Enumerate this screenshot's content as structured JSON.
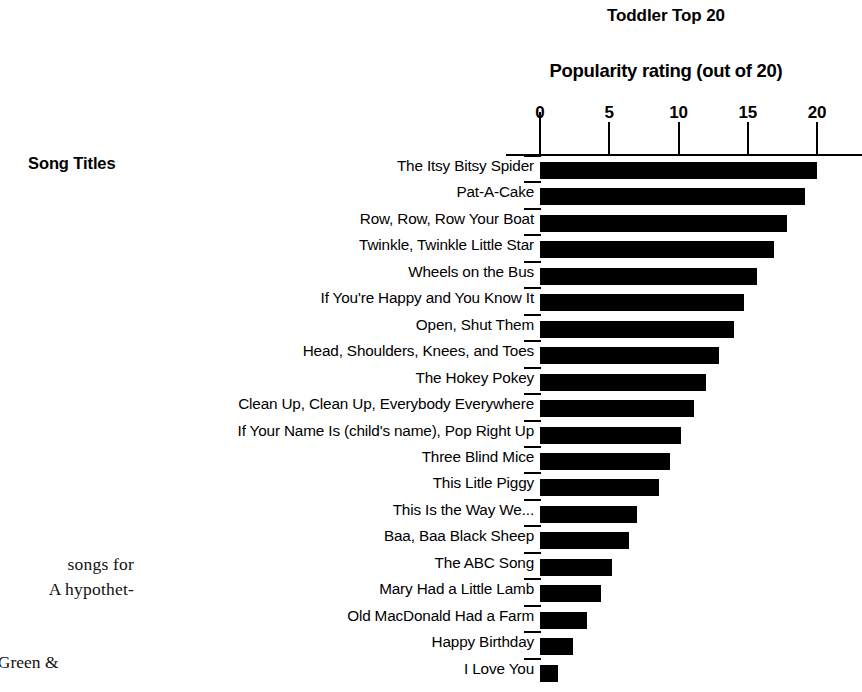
{
  "page_text": {
    "paragraph_lines": [
      "songs  for",
      "A hypothet-"
    ],
    "citation_line": "-Green &"
  },
  "chart_data": {
    "type": "bar",
    "orientation": "horizontal",
    "title": "Toddler Top 20",
    "xlabel": "Popularity rating (out of 20)",
    "ylabel": "Song Titles",
    "xlim": [
      0,
      20
    ],
    "xticks": [
      0,
      5,
      10,
      15,
      20
    ],
    "xtick_labels": [
      "0",
      "5",
      "10",
      "15",
      "20"
    ],
    "grid": false,
    "legend": false,
    "bar_color": "#000000",
    "categories": [
      "The Itsy Bitsy Spider",
      "Pat-A-Cake",
      "Row, Row, Row Your Boat",
      "Twinkle, Twinkle Little Star",
      "Wheels on the Bus",
      "If You're Happy and You Know It",
      "Open, Shut Them",
      "Head, Shoulders, Knees, and Toes",
      "The Hokey Pokey",
      "Clean Up, Clean Up, Everybody Everywhere",
      "If Your Name Is (child's name), Pop Right Up",
      "Three Blind Mice",
      "This Litle Piggy",
      "This Is the Way We...",
      "Baa, Baa Black Sheep",
      "The ABC Song",
      "Mary Had a Little Lamb",
      "Old MacDonald Had a Farm",
      "Happy Birthday",
      "I Love You"
    ],
    "values": [
      20.0,
      19.1,
      17.8,
      16.9,
      15.7,
      14.7,
      14.0,
      12.9,
      12.0,
      11.1,
      10.2,
      9.4,
      8.6,
      7.0,
      6.4,
      5.2,
      4.4,
      3.4,
      2.4,
      1.3
    ]
  }
}
